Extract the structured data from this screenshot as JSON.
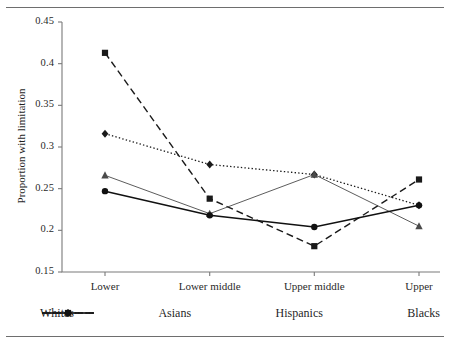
{
  "chart_data": {
    "type": "line",
    "title": "",
    "xlabel": "",
    "ylabel": "Proportion with limitation",
    "categories": [
      "Lower",
      "Lower middle",
      "Upper middle",
      "Upper"
    ],
    "ylim": [
      0.15,
      0.45
    ],
    "yticks": [
      "0.15",
      "0.2",
      "0.25",
      "0.3",
      "0.35",
      "0.4",
      "0.45"
    ],
    "ytick_values": [
      0.15,
      0.2,
      0.25,
      0.3,
      0.35,
      0.4,
      0.45
    ],
    "grid": false,
    "legend_position": "bottom",
    "series": [
      {
        "name": "Whites",
        "values": [
          0.316,
          0.279,
          0.267,
          0.23
        ],
        "line_style": "dotted",
        "marker": "diamond",
        "color": "#1a1a1a"
      },
      {
        "name": "Asians",
        "values": [
          0.413,
          0.238,
          0.181,
          0.261
        ],
        "line_style": "dashed",
        "marker": "square",
        "color": "#1a1a1a"
      },
      {
        "name": "Hispanics",
        "values": [
          0.266,
          0.22,
          0.267,
          0.205
        ],
        "line_style": "solid-thin",
        "marker": "triangle",
        "color": "#4a4a4a"
      },
      {
        "name": "Blacks",
        "values": [
          0.247,
          0.218,
          0.204,
          0.23
        ],
        "line_style": "solid",
        "marker": "circle",
        "color": "#111111"
      }
    ]
  }
}
